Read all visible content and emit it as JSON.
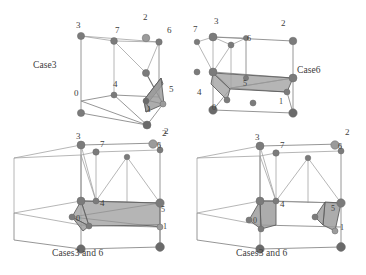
{
  "figure": {
    "background": "#ffffff",
    "edge_color": "#8a8a8a",
    "node_color": "#7b7b7b",
    "iso_fill": "#9a9a9a",
    "panels": [
      {
        "id": "top-left",
        "caption": "Case3",
        "caption_x": 33,
        "caption_y": 60,
        "shape": "cube",
        "vertex_labels": [
          {
            "text": "3",
            "x": 76,
            "y": 28
          },
          {
            "text": "7",
            "x": 115,
            "y": 33
          },
          {
            "text": "2",
            "x": 143,
            "y": 20
          },
          {
            "text": "6",
            "x": 167,
            "y": 33
          },
          {
            "text": "0",
            "x": 76,
            "y": 94
          },
          {
            "text": "4",
            "x": 115,
            "y": 84
          },
          {
            "text": "5",
            "x": 168,
            "y": 90
          },
          {
            "text": "1",
            "x": 150,
            "y": 105
          },
          {
            "text": "2",
            "x": 164,
            "y": 132
          }
        ]
      },
      {
        "id": "top-right",
        "caption": "Case6",
        "caption_x": 297,
        "caption_y": 65,
        "shape": "cube",
        "vertex_labels": [
          {
            "text": "7",
            "x": 194,
            "y": 30
          },
          {
            "text": "3",
            "x": 215,
            "y": 22
          },
          {
            "text": "6",
            "x": 248,
            "y": 39
          },
          {
            "text": "2",
            "x": 281,
            "y": 24
          },
          {
            "text": "4",
            "x": 197,
            "y": 92
          },
          {
            "text": "5",
            "x": 243,
            "y": 92
          },
          {
            "text": "0",
            "x": 212,
            "y": 107
          },
          {
            "text": "1",
            "x": 279,
            "y": 102
          }
        ]
      },
      {
        "id": "bottom-left",
        "caption": "Cases3 and 6",
        "caption_x": 52,
        "caption_y": 248,
        "shape": "box",
        "vertex_labels": [
          {
            "text": "3",
            "x": 76,
            "y": 139
          },
          {
            "text": "7",
            "x": 99,
            "y": 147
          },
          {
            "text": "2",
            "x": 163,
            "y": 132
          },
          {
            "text": "6",
            "x": 160,
            "y": 148
          },
          {
            "text": "4",
            "x": 101,
            "y": 203
          },
          {
            "text": "0",
            "x": 78,
            "y": 217
          },
          {
            "text": "5",
            "x": 159,
            "y": 207
          },
          {
            "text": "1",
            "x": 162,
            "y": 224
          }
        ]
      },
      {
        "id": "bottom-right",
        "caption": "Cases3 and 6",
        "caption_x": 236,
        "caption_y": 248,
        "shape": "box",
        "vertex_labels": [
          {
            "text": "3",
            "x": 260,
            "y": 140
          },
          {
            "text": "7",
            "x": 292,
            "y": 148
          },
          {
            "text": "2",
            "x": 347,
            "y": 131
          },
          {
            "text": "6",
            "x": 342,
            "y": 149
          },
          {
            "text": "4",
            "x": 290,
            "y": 202
          },
          {
            "text": "0",
            "x": 269,
            "y": 218
          },
          {
            "text": "5",
            "x": 340,
            "y": 204
          },
          {
            "text": "1",
            "x": 344,
            "y": 225
          }
        ]
      }
    ]
  }
}
